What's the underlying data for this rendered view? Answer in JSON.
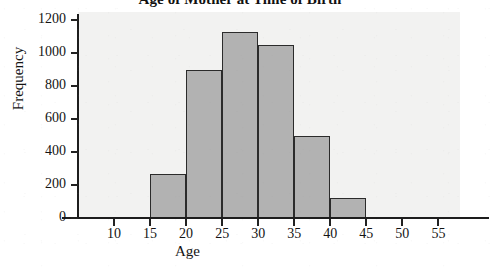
{
  "chart_data": {
    "type": "bar",
    "title": "Age of Mother at Time of Birth",
    "xlabel": "Age",
    "ylabel": "Frequency",
    "grid": false,
    "legend": false,
    "legend_position": "none",
    "bin_width": 5,
    "xlim": [
      5,
      58
    ],
    "ylim": [
      0,
      1250
    ],
    "xticks": [
      "10",
      "15",
      "20",
      "25",
      "30",
      "35",
      "40",
      "45",
      "50",
      "55"
    ],
    "yticks": [
      "0",
      "200",
      "400",
      "600",
      "800",
      "1000",
      "1200"
    ],
    "categories": [
      "10-15",
      "15-20",
      "20-25",
      "25-30",
      "30-35",
      "35-40",
      "40-45",
      "45-50",
      "50-55"
    ],
    "bin_starts": [
      10,
      15,
      20,
      25,
      30,
      35,
      40,
      45,
      50
    ],
    "values": [
      0,
      270,
      900,
      1130,
      1050,
      500,
      120,
      0,
      0
    ],
    "colors": {
      "bar_fill": "#b2b2b2",
      "bar_edge": "#2b2b2b",
      "panel_background": "#f2f2f1",
      "axis": "#1d1d1d",
      "text": "#141414"
    }
  }
}
